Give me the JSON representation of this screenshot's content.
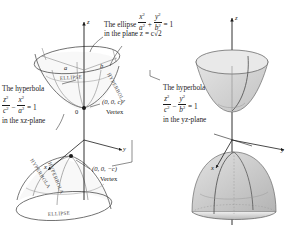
{
  "figure": {
    "left_panel": {
      "axes": [
        {
          "name": "z",
          "label": "z"
        },
        {
          "name": "y",
          "label": "y"
        },
        {
          "name": "x",
          "label": "x"
        }
      ],
      "origin_label": "0",
      "ellipse_semiaxis_a": "a",
      "ellipse_semiaxis_b": "b",
      "curve_labels": [
        "ELLIPSE",
        "HYPERBOLA",
        "HYPERBOLA",
        "HYPERBOLA",
        "ELLIPSE"
      ],
      "annotations": {
        "ellipse_top_line1_pre": "The ellipse",
        "ellipse_top_frac1_num": "x",
        "ellipse_top_frac1_den": "a",
        "ellipse_top_plus": "+",
        "ellipse_top_frac2_num": "y",
        "ellipse_top_frac2_den": "b",
        "ellipse_top_eq": "= 1",
        "ellipse_top_line2": "in the plane z = c√2",
        "hyp_left_line1": "The hyperbola",
        "hyp_left_frac1_num": "z",
        "hyp_left_frac1_den": "c",
        "hyp_left_minus": "−",
        "hyp_left_frac2_num": "x",
        "hyp_left_frac2_den": "a",
        "hyp_left_eq": "= 1",
        "hyp_left_line3": "in the xz-plane",
        "hyp_right_line1": "The hyperbola",
        "hyp_right_frac1_num": "z",
        "hyp_right_frac1_den": "c",
        "hyp_right_minus": "−",
        "hyp_right_frac2_num": "y",
        "hyp_right_frac2_den": "b",
        "hyp_right_eq": "= 1",
        "hyp_right_line3": "in the yz-plane",
        "vertex_top_point": "(0, 0, c)",
        "vertex_top_label": "Vertex",
        "vertex_bottom_point": "(0, 0, −c)",
        "vertex_bottom_label": "Vertex"
      }
    },
    "right_panel": {
      "axes": [
        {
          "name": "z",
          "label": "z"
        },
        {
          "name": "y",
          "label": "y"
        },
        {
          "name": "x",
          "label": "x"
        }
      ],
      "description": "shaded hyperboloid of two sheets"
    },
    "colors": {
      "ink": "#1a1a1a",
      "curve": "#555555",
      "surface_fill": "#d9d9d9",
      "surface_fill_dark": "#bdbdbd",
      "background": "#ffffff"
    }
  }
}
